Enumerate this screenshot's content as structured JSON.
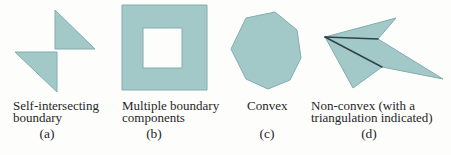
{
  "figure": {
    "colors": {
      "background": "#fdfdfc",
      "shape_fill": "#a3c8c8",
      "shape_edge": "#82aeae",
      "diagonal": "#2e4347",
      "text": "#262626"
    },
    "panels": [
      {
        "marker": "(a)",
        "caption_line1": "Self-intersecting",
        "caption_line2": "boundary",
        "shape": "self-intersecting-bowtie"
      },
      {
        "marker": "(b)",
        "caption_line1": "Multiple boundary",
        "caption_line2": "components",
        "shape": "square-with-square-hole"
      },
      {
        "marker": "(c)",
        "caption_line1": "Convex",
        "caption_line2": "",
        "shape": "convex-polygon"
      },
      {
        "marker": "(d)",
        "caption_line1": "Non-convex (with a",
        "caption_line2": "triangulation indicated)",
        "shape": "non-convex-dart-with-triangulation"
      }
    ]
  }
}
